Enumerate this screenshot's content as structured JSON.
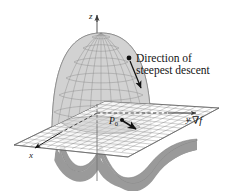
{
  "figure": {
    "background_color": "#ffffff"
  },
  "axes": {
    "z_label": "z",
    "y_label": "y",
    "x_label": "x",
    "axis_color": "#555555"
  },
  "labels": {
    "callout_line1": "Direction of",
    "callout_line2": "steepest descent",
    "point_label": "P",
    "point_subscript": "0",
    "gradient_label_sign": "−",
    "gradient_label_nabla": "∇",
    "gradient_label_function": "f"
  },
  "surface": {
    "dome_fill": "#cfcfcf",
    "dome_mesh_color": "#8a8a8a",
    "skirt_fill": "#9a9a9a",
    "skirt_edge_color": "#6e6e6e",
    "plane_fill": "#ffffff",
    "plane_grid_color": "#7d7d7d"
  },
  "annotations": {
    "arrow_color": "#111111",
    "dot_color": "#111111"
  }
}
